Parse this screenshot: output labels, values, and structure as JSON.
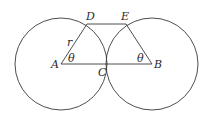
{
  "diagram": {
    "type": "two tangent circles with trapezoid",
    "stroke_color": "#3a3a3a",
    "circles": [
      {
        "name": "left-circle",
        "center": "A",
        "cx": 61,
        "cy": 64,
        "r": 46
      },
      {
        "name": "right-circle",
        "center": "B",
        "cx": 152,
        "cy": 64,
        "r": 46
      }
    ],
    "points": {
      "A": {
        "x": 61,
        "y": 64
      },
      "B": {
        "x": 152,
        "y": 64
      },
      "C": {
        "x": 106.5,
        "y": 64
      },
      "D": {
        "x": 87,
        "y": 24
      },
      "E": {
        "x": 126,
        "y": 24
      }
    },
    "segments": [
      [
        "A",
        "B"
      ],
      [
        "A",
        "D"
      ],
      [
        "D",
        "E"
      ],
      [
        "E",
        "B"
      ]
    ],
    "labels": {
      "A": "A",
      "B": "B",
      "C": "C",
      "D": "D",
      "E": "E",
      "radius": "r",
      "angle_left": "θ",
      "angle_right": "θ"
    }
  }
}
